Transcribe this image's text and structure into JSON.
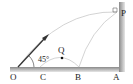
{
  "diagram": {
    "labels": {
      "O": "O",
      "C": "C",
      "B": "B",
      "A": "A",
      "P": "P",
      "Q": "Q",
      "angle": "45°"
    },
    "colors": {
      "ground": "#9a9a9a",
      "wall": "#9a9a9a",
      "trajectory": "#c8c8c8",
      "arrow": "#333333",
      "text": "#222222"
    }
  }
}
